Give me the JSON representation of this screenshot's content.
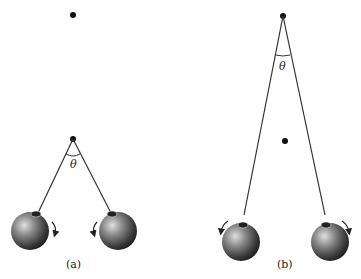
{
  "figure": {
    "panels": [
      {
        "id": "a",
        "caption": "(a)",
        "angle_label": "θ",
        "description": "Pendulum pair with short strings; pivot low, upper dot above",
        "rotation_arrows": [
          "clockwise-on-left-ball",
          "counterclockwise-on-right-ball"
        ]
      },
      {
        "id": "b",
        "caption": "(b)",
        "angle_label": "θ",
        "description": "Pendulum pair with long strings; pivot high, dot in middle",
        "rotation_arrows": [
          "counterclockwise-on-left-ball",
          "clockwise-on-right-ball"
        ]
      }
    ],
    "colors": {
      "line": "#333333",
      "ball_dark": "#1a1a1a",
      "ball_light": "#d9d9d9"
    }
  }
}
